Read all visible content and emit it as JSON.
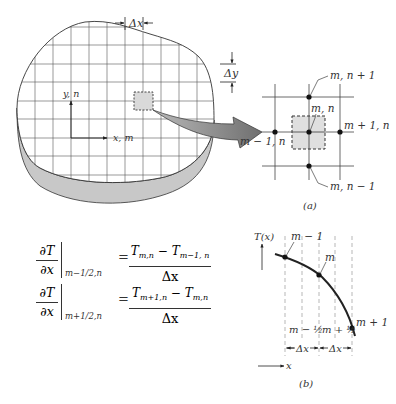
{
  "figure": {
    "panel_a": {
      "caption": "(a)",
      "plate_labels": {
        "dx": "Δx",
        "dy": "Δy",
        "y_axis": "y, n",
        "x_axis": "x, m"
      },
      "node_labels": {
        "top": "m, n + 1",
        "center": "m, n",
        "right": "m + 1, n",
        "left": "m − 1, n",
        "bottom": "m, n − 1"
      }
    },
    "panel_b": {
      "caption": "(b)",
      "y_axis_label": "T(x)",
      "x_axis_label": "x",
      "point_labels": [
        "m − 1",
        "m",
        "m + 1"
      ],
      "half_labels": [
        "m − ½",
        "m + ½"
      ],
      "spacing_labels": [
        "Δx",
        "Δx"
      ]
    },
    "equations": [
      {
        "lhs_num": "∂T",
        "lhs_den": "∂x",
        "eval_at": "m−1/2,n",
        "equals": "=",
        "rhs_num_a": "T",
        "rhs_num_a_sub": "m,n",
        "rhs_minus": " − ",
        "rhs_num_b": "T",
        "rhs_num_b_sub": "m−1, n",
        "rhs_den": "Δx"
      },
      {
        "lhs_num": "∂T",
        "lhs_den": "∂x",
        "eval_at": "m+1/2,n",
        "equals": "=",
        "rhs_num_a": "T",
        "rhs_num_a_sub": "m+1,n",
        "rhs_minus": " − ",
        "rhs_num_b": "T",
        "rhs_num_b_sub": "m,n",
        "rhs_den": "Δx"
      }
    ],
    "colors": {
      "line": "#333333",
      "grid": "#555555",
      "plate_edge_fill": "#c8c8c8",
      "cell_fill": "#d9d9d9",
      "arrow_fill": "#8a8a8a"
    }
  }
}
